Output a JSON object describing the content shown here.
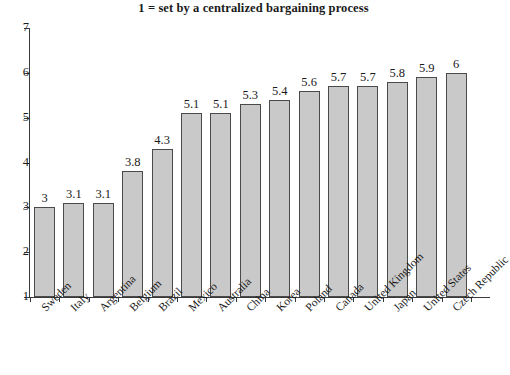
{
  "chart_data": {
    "type": "bar",
    "title": "1 = set by a centralized bargaining process",
    "xlabel": "",
    "ylabel": "",
    "ylim": [
      1,
      7
    ],
    "yticks": [
      1,
      2,
      3,
      4,
      5,
      6,
      7
    ],
    "grid": false,
    "legend": null,
    "orientation": "vertical",
    "bar_color": "#c9c9c9",
    "bar_edge_color": "#4a4a4a",
    "categories": [
      "Sweden",
      "Italy",
      "Argentina",
      "Belgium",
      "Brazil",
      "Mexico",
      "Australia",
      "China",
      "Korea",
      "Poland",
      "Canada",
      "United Kingdom",
      "Japan",
      "United States",
      "Czech Republic"
    ],
    "values": [
      3,
      3.1,
      3.1,
      3.8,
      4.3,
      5.1,
      5.1,
      5.3,
      5.4,
      5.6,
      5.7,
      5.7,
      5.8,
      5.9,
      6
    ],
    "value_labels": [
      "3",
      "3.1",
      "3.1",
      "3.8",
      "4.3",
      "5.1",
      "5.1",
      "5.3",
      "5.4",
      "5.6",
      "5.7",
      "5.7",
      "5.8",
      "5.9",
      "6"
    ],
    "ytick_labels": [
      "1",
      "2",
      "3",
      "4",
      "5",
      "6",
      "7"
    ]
  }
}
